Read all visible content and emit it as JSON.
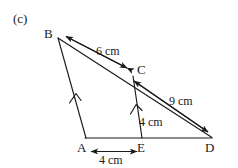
{
  "figure": {
    "part_label": "(c)",
    "stroke_color": "#1a1a1a",
    "background_color": "#ffffff",
    "vertices": [
      {
        "name": "B",
        "label": "B",
        "x": 57,
        "y": 37,
        "label_x": 44,
        "label_y": 28
      },
      {
        "name": "C",
        "label": "C",
        "x": 133,
        "y": 76,
        "label_x": 136,
        "label_y": 64
      },
      {
        "name": "D",
        "label": "D",
        "x": 212,
        "y": 138,
        "label_x": 205,
        "label_y": 141
      },
      {
        "name": "A",
        "label": "A",
        "x": 86,
        "y": 138,
        "label_x": 77,
        "label_y": 141
      },
      {
        "name": "E",
        "label": "E",
        "x": 142,
        "y": 138,
        "label_x": 138,
        "label_y": 141
      }
    ],
    "measurements": [
      {
        "name": "BC",
        "label": "6 cm",
        "value": 6,
        "unit": "cm",
        "label_x": 96,
        "label_y": 46
      },
      {
        "name": "CD",
        "label": "9 cm",
        "value": 9,
        "unit": "cm",
        "label_x": 169,
        "label_y": 96
      },
      {
        "name": "CE",
        "label": "4 cm",
        "value": 4,
        "unit": "cm",
        "label_x": 139,
        "label_y": 115
      },
      {
        "name": "AE",
        "label": "4 cm",
        "value": 4,
        "unit": "cm",
        "label_x": 99,
        "label_y": 153
      }
    ],
    "parallel_marks": [
      {
        "name": "parallel-mark-ba"
      },
      {
        "name": "parallel-mark-ce"
      }
    ]
  }
}
